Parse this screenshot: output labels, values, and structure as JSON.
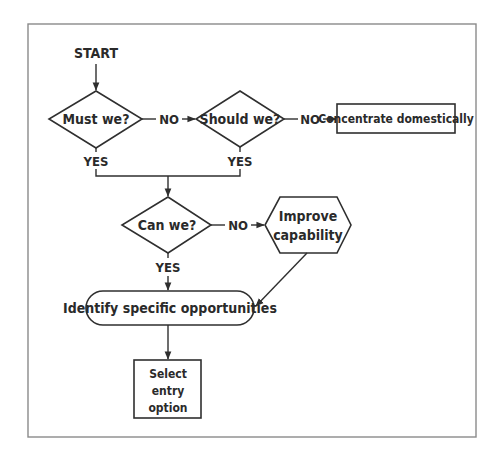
{
  "diagram": {
    "type": "flowchart",
    "frame_color": "#8a8a8a",
    "line_color": "#2f2f2f",
    "nodes": {
      "start": {
        "label": "START",
        "shape": "terminal-text"
      },
      "must": {
        "label": "Must we?",
        "shape": "diamond"
      },
      "should": {
        "label": "Should we?",
        "shape": "diamond"
      },
      "concentrate": {
        "label": "Concentrate domestically",
        "shape": "rectangle"
      },
      "can": {
        "label": "Can we?",
        "shape": "diamond"
      },
      "improve": {
        "label_line1": "Improve",
        "label_line2": "capability",
        "shape": "hexagon"
      },
      "identify": {
        "label": "Identify specific opportunities",
        "shape": "rounded-rectangle"
      },
      "select": {
        "label_line1": "Select",
        "label_line2": "entry",
        "label_line3": "option",
        "shape": "rectangle"
      }
    },
    "edge_labels": {
      "must_no": "NO",
      "should_no": "NO",
      "can_no": "NO",
      "must_yes": "YES",
      "should_yes": "YES",
      "can_yes": "YES"
    },
    "edges": [
      {
        "from": "start",
        "to": "must",
        "label": ""
      },
      {
        "from": "must",
        "to": "should",
        "label": "NO"
      },
      {
        "from": "should",
        "to": "concentrate",
        "label": "NO"
      },
      {
        "from": "must",
        "to": "can",
        "label": "YES"
      },
      {
        "from": "should",
        "to": "can",
        "label": "YES"
      },
      {
        "from": "can",
        "to": "improve",
        "label": "NO"
      },
      {
        "from": "can",
        "to": "identify",
        "label": "YES"
      },
      {
        "from": "improve",
        "to": "identify",
        "label": ""
      },
      {
        "from": "identify",
        "to": "select",
        "label": ""
      }
    ]
  }
}
